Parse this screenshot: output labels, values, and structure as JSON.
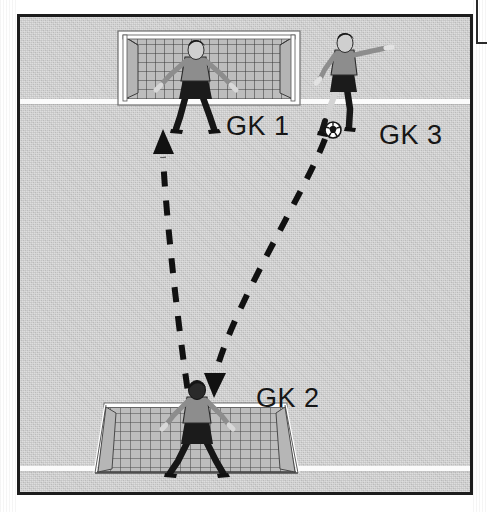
{
  "diagram": {
    "field": {
      "surface_color": "#c4c4c4",
      "line_color": "#fbfbfb",
      "border_color": "#1d1d1d",
      "lines": [
        {
          "name": "upper-field-line",
          "orientation": "horizontal"
        },
        {
          "name": "lower-field-line",
          "orientation": "horizontal"
        }
      ]
    },
    "labels": [
      {
        "id": "gk1",
        "text": "GK 1"
      },
      {
        "id": "gk2",
        "text": "GK 2"
      },
      {
        "id": "gk3",
        "text": "GK 3"
      }
    ],
    "goals": [
      {
        "id": "goal-top",
        "position": "top",
        "occupied_by": "GK 1",
        "view": "front"
      },
      {
        "id": "goal-bottom",
        "position": "bottom",
        "occupied_by": "GK 2",
        "view": "rear"
      }
    ],
    "players": [
      {
        "id": "gk1",
        "label": "GK 1",
        "pose": "ready-stance-arms-spread",
        "location": "in top goal"
      },
      {
        "id": "gk2",
        "label": "GK 2",
        "pose": "ready-stance-arms-spread",
        "location": "in bottom goal"
      },
      {
        "id": "gk3",
        "label": "GK 3",
        "pose": "kicking",
        "location": "right of top goal",
        "has_ball": true
      }
    ],
    "ball": {
      "id": "soccer-ball",
      "near": "GK 3",
      "color": "#ffffff",
      "panel_color": "#151515"
    },
    "arrows": [
      {
        "id": "arrow-serve",
        "style": "dashed",
        "description": "ball served from GK 3 down to GK 2",
        "from": "GK 3",
        "to": "GK 2",
        "direction": "down-left",
        "color": "#111111"
      },
      {
        "id": "arrow-return",
        "style": "dashed",
        "description": "distribution from GK 2 up toward GK 1",
        "from": "GK 2",
        "to": "GK 1",
        "direction": "up",
        "color": "#111111"
      }
    ]
  }
}
